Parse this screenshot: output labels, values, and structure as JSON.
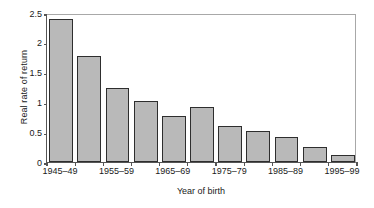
{
  "chart_data": {
    "type": "bar",
    "title": "",
    "xlabel": "Year of birth",
    "ylabel": "Real rate of return",
    "categories": [
      "1945–49",
      "1950–54",
      "1955–59",
      "1960–64",
      "1965–69",
      "1970–74",
      "1975–79",
      "1980–84",
      "1985–89",
      "1990–94",
      "1995–99"
    ],
    "values": [
      2.4,
      1.78,
      1.24,
      1.03,
      0.78,
      0.92,
      0.61,
      0.52,
      0.42,
      0.26,
      0.12
    ],
    "ylim": [
      0,
      2.5
    ],
    "yticks": [
      0,
      0.5,
      1,
      1.5,
      2,
      2.5
    ],
    "ytick_labels": [
      "0",
      "0.5",
      "1",
      "1.5",
      "2",
      "2.5"
    ],
    "xtick_labels_shown": [
      "1945–49",
      "1955–59",
      "1965–69",
      "1975–79",
      "1985–89",
      "1995–99"
    ],
    "xtick_label_indices": [
      0,
      2,
      4,
      6,
      8,
      10
    ],
    "grid": false,
    "legend": null,
    "bar_fill_color": "#b9b9b9",
    "bar_edge_color": "#2e2e2e",
    "axis_color": "#555555",
    "background_color": "#ffffff"
  }
}
